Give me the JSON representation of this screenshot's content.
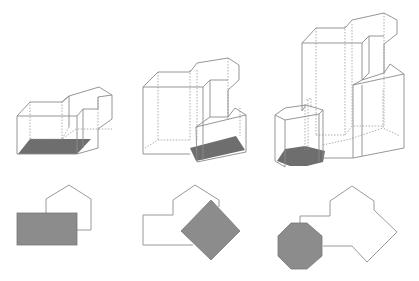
{
  "figure": {
    "panels": [
      {
        "id": "panel-1",
        "footprint_shape": "rectangle",
        "extrusion": "shallow",
        "label": ""
      },
      {
        "id": "panel-2",
        "footprint_shape": "rotated-square",
        "extrusion": "medium",
        "label": ""
      },
      {
        "id": "panel-3",
        "footprint_shape": "octagon",
        "extrusion": "tall",
        "label": ""
      }
    ]
  },
  "colors": {
    "fill": "#8c8c8c",
    "base_fill": "#6e6e6e",
    "edge": "#8a8a8a"
  }
}
